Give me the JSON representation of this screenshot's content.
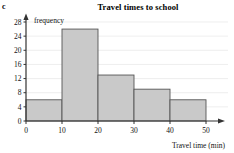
{
  "part_label": "c",
  "chart_data": {
    "type": "bar",
    "title": "Travel times to school",
    "xlabel": "Travel time (min)",
    "ylabel": "frequency",
    "categories": [
      "0-10",
      "10-20",
      "20-30",
      "30-40",
      "40-50"
    ],
    "bin_edges": [
      0,
      10,
      20,
      30,
      40,
      50
    ],
    "values": [
      6,
      26,
      13,
      9,
      6
    ],
    "xlim": [
      0,
      50
    ],
    "ylim": [
      0,
      28
    ],
    "x_ticks": [
      "0",
      "10",
      "20",
      "30",
      "40",
      "50"
    ],
    "y_ticks": [
      "0",
      "4",
      "8",
      "12",
      "16",
      "20",
      "24",
      "28"
    ],
    "grid": true,
    "legend": null,
    "bar_fill_color": "#c9c9c9",
    "bar_border_color": "#555555",
    "axis_color": "#333333",
    "grid_color": "#e2e2e2"
  }
}
